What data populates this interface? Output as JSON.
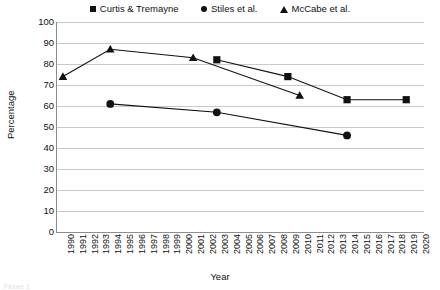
{
  "chart_data": {
    "type": "line",
    "title": "",
    "xlabel": "Year",
    "ylabel": "Percentage",
    "ylim": [
      0,
      100
    ],
    "ytick_step": 10,
    "yticks": [
      100,
      90,
      80,
      70,
      60,
      50,
      40,
      30,
      20,
      10,
      0
    ],
    "grid": true,
    "legend_position": "top-center",
    "categories": [
      "1990",
      "1991",
      "1992",
      "1993",
      "1994",
      "1995",
      "1996",
      "1997",
      "1998",
      "1999",
      "2000",
      "2001",
      "2002",
      "2003",
      "2004",
      "2005",
      "2006",
      "2007",
      "2008",
      "2009",
      "2010",
      "2011",
      "2012",
      "2013",
      "2014",
      "2015",
      "2016",
      "2017",
      "2018",
      "2019",
      "2020"
    ],
    "series": [
      {
        "name": "Curtis & Tremayne",
        "marker": "square",
        "color": "#111111",
        "points": [
          {
            "x": "2003",
            "y": 82
          },
          {
            "x": "2009",
            "y": 74
          },
          {
            "x": "2014",
            "y": 63
          },
          {
            "x": "2019",
            "y": 63
          }
        ]
      },
      {
        "name": "Stiles et al.",
        "marker": "circle",
        "color": "#111111",
        "points": [
          {
            "x": "1994",
            "y": 61
          },
          {
            "x": "2003",
            "y": 57
          },
          {
            "x": "2014",
            "y": 46
          }
        ]
      },
      {
        "name": "McCabe et al.",
        "marker": "triangle",
        "color": "#111111",
        "points": [
          {
            "x": "1990",
            "y": 74
          },
          {
            "x": "1994",
            "y": 87
          },
          {
            "x": "2001",
            "y": 83
          },
          {
            "x": "2010",
            "y": 65
          }
        ]
      }
    ]
  },
  "legend": {
    "items": [
      {
        "label": "Curtis & Tremayne",
        "marker": "square"
      },
      {
        "label": "Stiles et al.",
        "marker": "circle"
      },
      {
        "label": "McCabe et al.",
        "marker": "triangle"
      }
    ]
  },
  "axes": {
    "y_title": "Percentage",
    "x_title": "Year"
  },
  "caption": {
    "fragment": "Figure 1"
  }
}
